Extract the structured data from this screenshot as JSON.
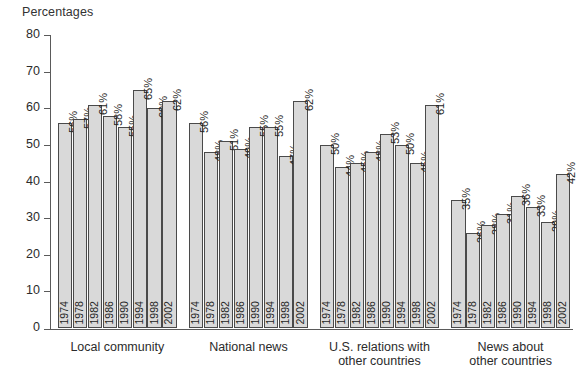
{
  "chart_data": {
    "type": "bar",
    "title": "",
    "ylabel": "Percentages",
    "xlabel": "",
    "ylim": [
      0,
      80
    ],
    "ytick_step": 10,
    "yticks": [
      0,
      10,
      20,
      30,
      40,
      50,
      60,
      70,
      80
    ],
    "grid": false,
    "legend": "none",
    "value_label_suffix": "%",
    "categories": [
      "1974",
      "1978",
      "1982",
      "1986",
      "1990",
      "1994",
      "1998",
      "2002"
    ],
    "groups": [
      {
        "name": "Local community",
        "label_lines": [
          "Local community"
        ],
        "values": [
          56,
          57,
          61,
          58,
          55,
          65,
          60,
          62
        ],
        "value_labels": [
          "56%",
          "57%",
          "61%",
          "58%",
          "55%",
          "65%",
          "60%",
          "62%"
        ]
      },
      {
        "name": "National news",
        "label_lines": [
          "National news"
        ],
        "values": [
          56,
          48,
          51,
          49,
          55,
          55,
          47,
          62
        ],
        "value_labels": [
          "56%",
          "48%",
          "51%",
          "49%",
          "55%",
          "55%",
          "47%",
          "62%"
        ]
      },
      {
        "name": "U.S. relations with other countries",
        "label_lines": [
          "U.S. relations with",
          "other countries"
        ],
        "values": [
          50,
          44,
          45,
          48,
          53,
          50,
          45,
          61
        ],
        "value_labels": [
          "50%",
          "44%",
          "45%",
          "48%",
          "53%",
          "50%",
          "45%",
          "61%"
        ]
      },
      {
        "name": "News about other countries",
        "label_lines": [
          "News about",
          "other countries"
        ],
        "values": [
          35,
          26,
          28,
          31,
          36,
          33,
          29,
          42
        ],
        "value_labels": [
          "35%",
          "26%",
          "28%",
          "31%",
          "36%",
          "33%",
          "29%",
          "42%"
        ]
      }
    ],
    "colors": {
      "bar_fill": "#d9d9d9",
      "bar_stroke": "#4a4a4a",
      "axis": "#5a5a5a",
      "text": "#2b2b2b",
      "background": "#ffffff"
    }
  }
}
